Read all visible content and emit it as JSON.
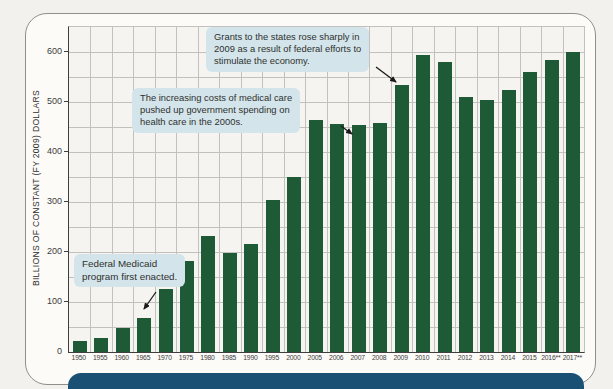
{
  "chart_data": {
    "type": "bar",
    "title": "",
    "xlabel": "",
    "ylabel": "BILLIONS OF CONSTANT (FY 2009) DOLLARS",
    "categories": [
      "1950",
      "1955",
      "1960",
      "1965",
      "1970",
      "1975",
      "1980",
      "1985",
      "1990",
      "1995",
      "2000",
      "2005",
      "2006",
      "2007",
      "2008",
      "2009",
      "2010",
      "2011",
      "2012",
      "2013",
      "2014",
      "2015",
      "2016**",
      "2017**"
    ],
    "values": [
      22,
      29,
      49,
      68,
      127,
      182,
      232,
      198,
      217,
      305,
      350,
      465,
      457,
      455,
      459,
      535,
      595,
      580,
      510,
      505,
      525,
      560,
      585,
      600
    ],
    "ylim": [
      0,
      650
    ],
    "ytick_step": 100,
    "ytick_max": 600,
    "minor_grid_step": 50,
    "grid": true,
    "legend": false,
    "bar_color": "#1e5a36",
    "annotations": [
      {
        "id": "medicaid",
        "text": "Federal Medicaid\nprogram first enacted.",
        "target_year": "1965"
      },
      {
        "id": "medical-costs",
        "text": "The increasing costs of medical care\npushed up government spending on\nhealth care in the 2000s.",
        "target_year": "2005"
      },
      {
        "id": "grants-2009",
        "text": "Grants to the states rose sharply in\n2009 as a result of federal efforts to\nstimulate the economy.",
        "target_year": "2009"
      }
    ]
  },
  "colors": {
    "bar": "#1e5a36",
    "annotation_bg": "#d3e5ea",
    "banner_blue": "#1a5074",
    "plot_bg": "#f5f4f1",
    "grid": "#c2c1be",
    "axis": "#3f3f3f",
    "text": "#3c3c3c"
  }
}
